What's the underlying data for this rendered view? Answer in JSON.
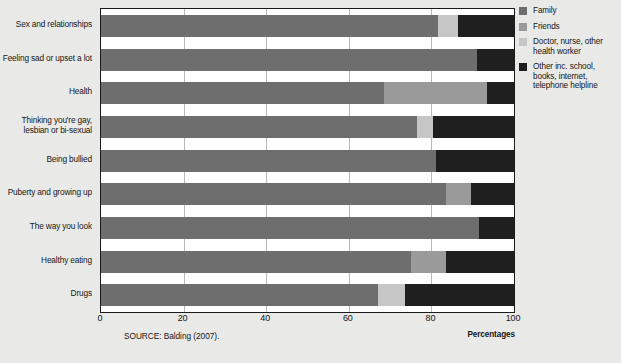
{
  "chart_data": {
    "type": "bar",
    "orientation": "horizontal",
    "stacked": true,
    "title": "",
    "subtitle": "",
    "xlabel": "Percentages",
    "ylabel": "",
    "xlim": [
      0,
      100
    ],
    "xticks": [
      "0",
      "20",
      "40",
      "60",
      "80",
      "100"
    ],
    "xtick_values": [
      0,
      20,
      40,
      60,
      80,
      100
    ],
    "grid": true,
    "grid_axis": "x",
    "legend_position": "right",
    "categories": [
      "Sex and relationships",
      "Feeling sad or upset a lot",
      "Health",
      "Thinking you're gay,\nlesbian or bi-sexual",
      "Being bullied",
      "Puberty and growing up",
      "The way you look",
      "Healthy eating",
      "Drugs"
    ],
    "series": [
      {
        "name": "Family",
        "color": "#6e6e6e",
        "values": [
          81.5,
          91.0,
          68.5,
          76.5,
          81.0,
          83.5,
          91.5,
          75.0,
          67.0
        ]
      },
      {
        "name": "Friends",
        "color": "#9a9a9a",
        "values": [
          0,
          0,
          25.0,
          0,
          0,
          6.0,
          0,
          8.5,
          0
        ]
      },
      {
        "name": "Doctor, nurse, other\nhealth worker",
        "color": "#c6c6c6",
        "values": [
          5.0,
          0,
          0,
          4.0,
          0,
          0,
          0,
          0,
          6.5
        ]
      },
      {
        "name": "Other inc. school,\nbooks, internet,\ntelephone helpline",
        "color": "#201f1f",
        "values": [
          13.5,
          9.0,
          6.5,
          19.5,
          19.0,
          10.5,
          8.5,
          16.5,
          26.5
        ]
      }
    ],
    "source": "SOURCE:  Balding (2007)."
  },
  "legend": {
    "items": [
      {
        "label": "Family",
        "swatch": "#6e6e6e"
      },
      {
        "label": "Friends",
        "swatch": "#9a9a9a"
      },
      {
        "label": "Doctor, nurse, other\nhealth worker",
        "swatch": "#c6c6c6"
      },
      {
        "label": "Other inc. school,\nbooks, internet,\ntelephone helpline",
        "swatch": "#201f1f"
      }
    ]
  },
  "footer": {
    "source": "SOURCE:  Balding (2007).",
    "axis_unit": "Percentages"
  }
}
